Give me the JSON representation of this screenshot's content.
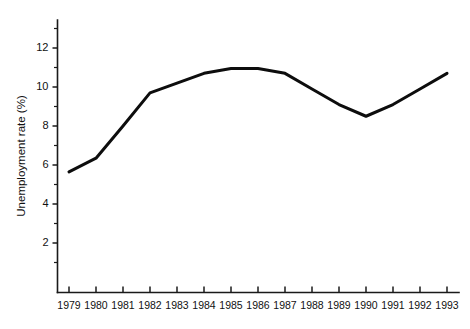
{
  "chart_data": {
    "type": "line",
    "title": "",
    "subtitle": "",
    "xlabel": "",
    "ylabel": "Unemployment rate (%)",
    "categories": [
      "1979",
      "1980",
      "1981",
      "1982",
      "1983",
      "1984",
      "1985",
      "1986",
      "1987",
      "1988",
      "1989",
      "1990",
      "1991",
      "1992",
      "1993"
    ],
    "x": [
      1979,
      1980,
      1981,
      1982,
      1983,
      1984,
      1985,
      1986,
      1987,
      1988,
      1989,
      1990,
      1991,
      1992,
      1993
    ],
    "values": [
      5.65,
      6.35,
      8.0,
      9.7,
      10.2,
      10.7,
      10.95,
      10.95,
      10.7,
      9.9,
      9.1,
      8.5,
      9.1,
      9.9,
      10.7
    ],
    "series": [
      {
        "name": "Unemployment rate",
        "values": [
          5.65,
          6.35,
          8.0,
          9.7,
          10.2,
          10.7,
          10.95,
          10.95,
          10.7,
          9.9,
          9.1,
          8.5,
          9.1,
          9.9,
          10.7
        ],
        "color": "#0d0d0d"
      }
    ],
    "xlim": [
      1978.6,
      1993.6
    ],
    "ylim": [
      0,
      13.3
    ],
    "y_major_ticks": [
      2,
      4,
      6,
      8,
      10,
      12
    ],
    "y_major_tick_labels": [
      "2",
      "4",
      "6",
      "8",
      "10",
      "12"
    ],
    "y_minor_ticks": [
      1,
      3,
      5,
      7,
      9,
      11,
      13
    ],
    "x_tick_labels": [
      "1979",
      "1980",
      "1981",
      "1982",
      "1983",
      "1984",
      "1985",
      "1986",
      "1987",
      "1988",
      "1989",
      "1990",
      "1991",
      "1992",
      "1993"
    ],
    "grid": false,
    "legend": false,
    "legend_position": "none",
    "annotations": [],
    "line_color": "#0d0d0d",
    "background_color": "#ffffff",
    "axis_color": "#1a1a1a"
  }
}
